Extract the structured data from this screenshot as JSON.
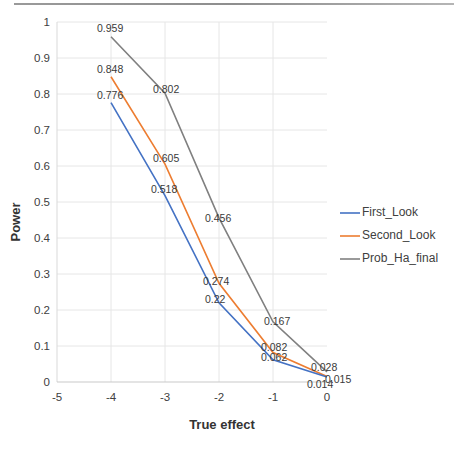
{
  "chart_data": {
    "type": "line",
    "title": "",
    "xlabel": "True effect",
    "ylabel": "Power",
    "x": [
      -4,
      -3,
      -2,
      -1,
      0
    ],
    "xlim": [
      -5,
      0
    ],
    "ylim": [
      0,
      1
    ],
    "xticks": [
      "-5",
      "-4",
      "-3",
      "-2",
      "-1",
      "0"
    ],
    "xtick_values": [
      -5,
      -4,
      -3,
      -2,
      -1,
      0
    ],
    "yticks": [
      "0",
      "0.1",
      "0.2",
      "0.3",
      "0.4",
      "0.5",
      "0.6",
      "0.7",
      "0.8",
      "0.9",
      "1"
    ],
    "ytick_values": [
      0,
      0.1,
      0.2,
      0.3,
      0.4,
      0.5,
      0.6,
      0.7,
      0.8,
      0.9,
      1
    ],
    "grid": true,
    "legend_position": "right",
    "series": [
      {
        "name": "First_Look",
        "color": "#4472C4",
        "values": [
          0.776,
          0.518,
          0.22,
          0.062,
          0.014
        ],
        "labels": [
          "0.776",
          "0.518",
          "0.22",
          "0.062",
          "0.014"
        ]
      },
      {
        "name": "Second_Look",
        "color": "#ED7D31",
        "values": [
          0.848,
          0.605,
          0.274,
          0.082,
          0.015
        ],
        "labels": [
          "0.848",
          "0.605",
          "0.274",
          "0.082",
          "0.015"
        ]
      },
      {
        "name": "Prob_Ha_final",
        "color": "#808080",
        "values": [
          0.959,
          0.802,
          0.456,
          0.167,
          0.028
        ],
        "labels": [
          "0.959",
          "0.802",
          "0.456",
          "0.167",
          "0.028"
        ]
      }
    ]
  },
  "axis": {
    "y_title": "Power",
    "x_title": "True effect",
    "y_tick_0": "0",
    "y_tick_1": "0.1",
    "y_tick_2": "0.2",
    "y_tick_3": "0.3",
    "y_tick_4": "0.4",
    "y_tick_5": "0.5",
    "y_tick_6": "0.6",
    "y_tick_7": "0.7",
    "y_tick_8": "0.8",
    "y_tick_9": "0.9",
    "y_tick_10": "1",
    "x_tick_0": "-5",
    "x_tick_1": "-4",
    "x_tick_2": "-3",
    "x_tick_3": "-2",
    "x_tick_4": "-1",
    "x_tick_5": "0"
  },
  "legend": {
    "item_0": "First_Look",
    "item_1": "Second_Look",
    "item_2": "Prob_Ha_final"
  },
  "labels": {
    "s0_p0": "0.776",
    "s0_p1": "0.518",
    "s0_p2": "0.22",
    "s0_p3": "0.062",
    "s0_p4": "0.014",
    "s1_p0": "0.848",
    "s1_p1": "0.605",
    "s1_p2": "0.274",
    "s1_p3": "0.082",
    "s1_p4": "0.015",
    "s2_p0": "0.959",
    "s2_p1": "0.802",
    "s2_p2": "0.456",
    "s2_p3": "0.167",
    "s2_p4": "0.028"
  },
  "colors": {
    "first_look": "#4472C4",
    "second_look": "#ED7D31",
    "prob_ha_final": "#808080",
    "grid": "#e6e6e6"
  }
}
